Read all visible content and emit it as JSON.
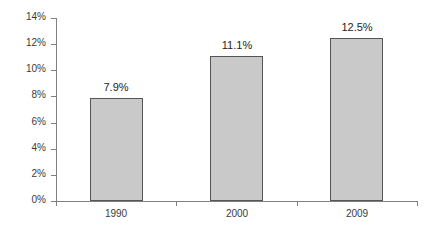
{
  "chart_data": {
    "type": "bar",
    "title": "",
    "subtitle": "",
    "xlabel": "",
    "ylabel": "",
    "categories": [
      "1990",
      "2000",
      "2009"
    ],
    "values": [
      7.9,
      11.1,
      12.5
    ],
    "data_labels": [
      "7.9%",
      "11.1%",
      "12.5%"
    ],
    "ylim": [
      0,
      14
    ],
    "ytick_values": [
      0,
      2,
      4,
      6,
      8,
      10,
      12,
      14
    ],
    "ytick_labels": [
      "0%",
      "2%",
      "4%",
      "6%",
      "8%",
      "10%",
      "12%",
      "14%"
    ],
    "grid": false,
    "legend": null,
    "legend_position": "none",
    "series": [
      {
        "name": "",
        "values": [
          7.9,
          11.1,
          12.5
        ]
      }
    ],
    "colors": {
      "bar_fill": "#c9c9c9",
      "bar_border": "#555555",
      "axis": "#808080",
      "text": "#3a3a3a",
      "label_text": "#1c1c1c",
      "background": "#ffffff"
    }
  }
}
